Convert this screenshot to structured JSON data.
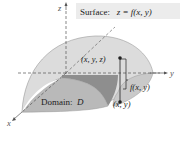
{
  "surface_label": {
    "prefix": "Surface:",
    "equation": "z = f(x, y)"
  },
  "labels": {
    "point_xyz": "(x, y, z)",
    "height": "f(x, y)",
    "point_xy": "(x, y)",
    "domain": "Domain:",
    "domain_symbol": "D"
  },
  "axes": {
    "x": "x",
    "y": "y",
    "z": "z"
  },
  "colors": {
    "surface_fill": "#dcdcdc",
    "surface_edge": "#9a9a9a",
    "domain_fill": "#b9b9b9",
    "shadow_fill": "#8e8e8e",
    "axis": "#555555",
    "label_box": "#ececec"
  }
}
